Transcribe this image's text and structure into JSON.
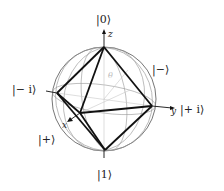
{
  "diagram": {
    "type": "bloch-sphere-octahedron",
    "labels": {
      "ket0": "|0⟩",
      "ket1": "|1⟩",
      "ket_plus": "|+⟩",
      "ket_minus": "|−⟩",
      "ket_plus_i": "|+ i⟩",
      "ket_minus_i": "|− i⟩"
    },
    "axes": {
      "x": "x",
      "y": "y",
      "z": "z"
    },
    "angle_label": "θ",
    "colors": {
      "octahedron": "#111111",
      "sphere": "#777777",
      "grid": "#bbbbbb"
    }
  }
}
